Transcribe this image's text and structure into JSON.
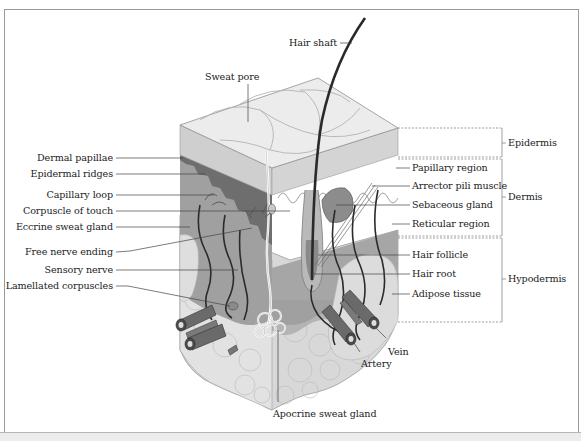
{
  "diagram": {
    "labels_left": [
      {
        "id": "dermal-papillae",
        "text": "Dermal papillae"
      },
      {
        "id": "epidermal-ridges",
        "text": "Epidermal ridges"
      },
      {
        "id": "capillary-loop",
        "text": "Capillary loop"
      },
      {
        "id": "corpuscle-of-touch",
        "text": "Corpuscle of touch"
      },
      {
        "id": "eccrine-sweat-gland",
        "text": "Eccrine sweat gland"
      },
      {
        "id": "free-nerve-ending",
        "text": "Free nerve ending"
      },
      {
        "id": "sensory-nerve",
        "text": "Sensory nerve"
      },
      {
        "id": "lamellated-corpuscles",
        "text": "Lamellated corpuscles"
      }
    ],
    "labels_top": [
      {
        "id": "sweat-pore",
        "text": "Sweat pore"
      },
      {
        "id": "hair-shaft",
        "text": "Hair shaft"
      }
    ],
    "labels_right": [
      {
        "id": "papillary-region",
        "text": "Papillary region"
      },
      {
        "id": "arrector-pili-muscle",
        "text": "Arrector pili muscle"
      },
      {
        "id": "sebaceous-gland",
        "text": "Sebaceous gland"
      },
      {
        "id": "reticular-region",
        "text": "Reticular region"
      },
      {
        "id": "hair-follicle",
        "text": "Hair follicle"
      },
      {
        "id": "hair-root",
        "text": "Hair root"
      },
      {
        "id": "adipose-tissue",
        "text": "Adipose tissue"
      }
    ],
    "labels_bottom": [
      {
        "id": "vein",
        "text": "Vein"
      },
      {
        "id": "artery",
        "text": "Artery"
      },
      {
        "id": "apocrine-sweat-gland",
        "text": "Apocrine sweat gland"
      }
    ],
    "layers": [
      {
        "id": "epidermis",
        "text": "Epidermis"
      },
      {
        "id": "dermis",
        "text": "Dermis"
      },
      {
        "id": "hypodermis",
        "text": "Hypodermis"
      }
    ],
    "colors": {
      "epidermis_top": "#e6e6e6",
      "epidermis_side": "#cfcfcf",
      "dermis": "#a9a9a9",
      "dermis_dark": "#7d7d7d",
      "hypodermis": "#d9d9d9",
      "vessel": "#2b2b2b",
      "label_text": "#222222",
      "leader_line": "#555555"
    }
  }
}
